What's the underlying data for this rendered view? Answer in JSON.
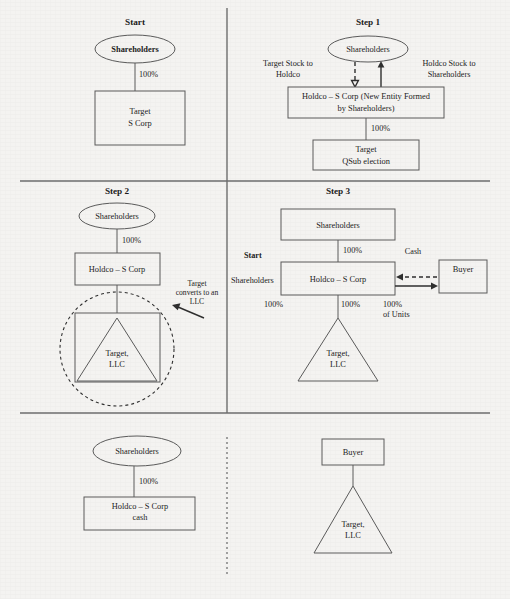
{
  "document": {
    "kind": "tax-restructuring-flow-diagram",
    "background_color": "#f4f3f1",
    "line_color": "#5a5a5a",
    "text_color": "#1b1b1b"
  },
  "panels": {
    "start": {
      "title": "Start",
      "shareholders": "Shareholders",
      "ownership": "100%",
      "target_line1": "Target",
      "target_line2": "S Corp"
    },
    "step1": {
      "title": "Step 1",
      "shareholders": "Shareholders",
      "label_left_line1": "Target Stock to",
      "label_left_line2": "Holdco",
      "label_right_line1": "Holdco Stock to",
      "label_right_line2": "Shareholders",
      "holdco_line1": "Holdco – S Corp (New Entity Formed",
      "holdco_line2": "by Shareholders)",
      "ownership": "100%",
      "target_line1": "Target",
      "target_line2": "QSub election"
    },
    "step2": {
      "title": "Step 2",
      "shareholders": "Shareholders",
      "ownership": "100%",
      "holdco": "Holdco – S Corp",
      "target_line1": "Target,",
      "target_line2": "LLC",
      "annotation_line1": "Target",
      "annotation_line2": "converts to an",
      "annotation_line3": "LLC"
    },
    "step3": {
      "title": "Step 3",
      "shareholders": "Shareholders",
      "ownership_top": "100%",
      "holdco": "Holdco – S Corp",
      "cash_label": "Cash",
      "buyer": "Buyer",
      "stray_start": "Start",
      "stray_shareholders": "Shareholders",
      "stray_pct": "100%",
      "ownership_mid": "100%",
      "units_line1": "100%",
      "units_line2": "of Units",
      "target_line1": "Target,",
      "target_line2": "LLC"
    },
    "result": {
      "title": "Result of Step 3",
      "left": {
        "shareholders": "Shareholders",
        "ownership": "100%",
        "holdco_line1": "Holdco – S Corp",
        "holdco_line2": "cash"
      },
      "right": {
        "buyer": "Buyer",
        "target_line1": "Target,",
        "target_line2": "LLC"
      }
    }
  }
}
